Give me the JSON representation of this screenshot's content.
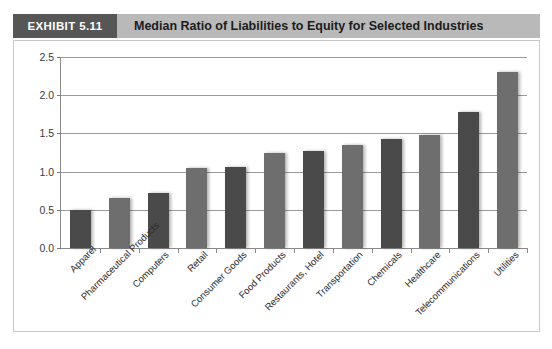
{
  "header": {
    "badge_label": "EXHIBIT 5.11",
    "title": "Median Ratio of Liabilities to Equity for Selected Industries",
    "badge_bg": "#565656",
    "title_bg": "#b9b9b9"
  },
  "chart_data": {
    "type": "bar",
    "title": "Median Ratio of Liabilities to Equity for Selected Industries",
    "xlabel": "",
    "ylabel": "",
    "ylim": [
      0.0,
      2.5
    ],
    "ytick_labels": [
      "0.0",
      "0.5",
      "1.0",
      "1.5",
      "2.0",
      "2.5"
    ],
    "ytick_values": [
      0.0,
      0.5,
      1.0,
      1.5,
      2.0,
      2.5
    ],
    "grid": true,
    "legend": "none",
    "categories": [
      "Apparel",
      "Pharmaceutical Products",
      "Computers",
      "Retail",
      "Consumer Goods",
      "Food Products",
      "Restaurants, Hotel",
      "Transportation",
      "Chemicals",
      "Healthcare",
      "Telecommunications",
      "Utilities"
    ],
    "values": [
      0.5,
      0.65,
      0.72,
      1.05,
      1.06,
      1.25,
      1.27,
      1.35,
      1.43,
      1.48,
      1.78,
      2.31
    ],
    "bar_colors": [
      "#4a4a4a",
      "#6e6e6e",
      "#4a4a4a",
      "#6e6e6e",
      "#4a4a4a",
      "#6e6e6e",
      "#4a4a4a",
      "#6e6e6e",
      "#4a4a4a",
      "#6e6e6e",
      "#4a4a4a",
      "#6e6e6e"
    ]
  }
}
